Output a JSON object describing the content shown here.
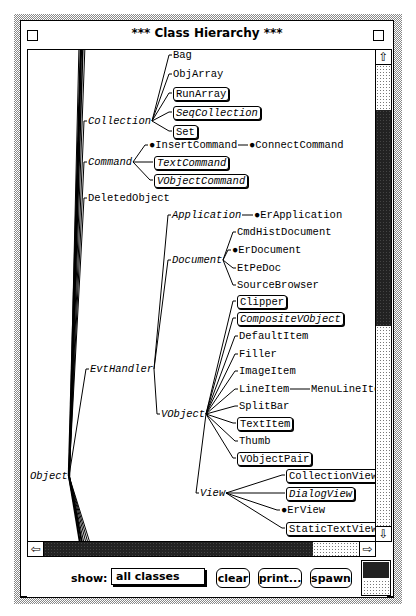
{
  "window": {
    "title": "*** Class Hierarchy ***",
    "close_box": "close-box",
    "zoom_box": "zoom-box"
  },
  "tree": {
    "nodes": [
      {
        "id": "Object",
        "label": "Object",
        "style": "abstract",
        "x": 2,
        "y": 420
      },
      {
        "id": "Collection",
        "label": "Collection",
        "style": "abstract",
        "x": 60,
        "y": 65
      },
      {
        "id": "Bag",
        "label": "Bag",
        "style": "plain",
        "x": 145,
        "y": -1
      },
      {
        "id": "ObjArray",
        "label": "ObjArray",
        "style": "plain",
        "x": 145,
        "y": 18
      },
      {
        "id": "RunArray",
        "label": "RunArray",
        "style": "boxed",
        "x": 145,
        "y": 37
      },
      {
        "id": "SeqCollection",
        "label": "SeqCollection",
        "style": "boxed-abstract",
        "x": 145,
        "y": 56
      },
      {
        "id": "Set",
        "label": "Set",
        "style": "boxed",
        "x": 145,
        "y": 75
      },
      {
        "id": "Command",
        "label": "Command",
        "style": "abstract",
        "x": 60,
        "y": 106
      },
      {
        "id": "InsertCommand",
        "label": "●InsertCommand",
        "style": "plain",
        "x": 121,
        "y": 89
      },
      {
        "id": "ConnectCommand",
        "label": "●ConnectCommand",
        "style": "plain",
        "x": 221,
        "y": 89
      },
      {
        "id": "TextCommand",
        "label": "TextCommand",
        "style": "boxed-abstract",
        "x": 126,
        "y": 106
      },
      {
        "id": "VObjectCommand",
        "label": "VObjectCommand",
        "style": "boxed-abstract",
        "x": 126,
        "y": 124
      },
      {
        "id": "DeletedObject",
        "label": "DeletedObject",
        "style": "plain",
        "x": 60,
        "y": 142
      },
      {
        "id": "Application",
        "label": "Application",
        "style": "abstract",
        "x": 144,
        "y": 159
      },
      {
        "id": "ErApplication",
        "label": "●ErApplication",
        "style": "plain",
        "x": 226,
        "y": 159
      },
      {
        "id": "Document",
        "label": "Document",
        "style": "abstract",
        "x": 144,
        "y": 204
      },
      {
        "id": "CmdHistDocument",
        "label": "CmdHistDocument",
        "style": "plain",
        "x": 209,
        "y": 176
      },
      {
        "id": "ErDocument",
        "label": "●ErDocument",
        "style": "plain",
        "x": 204,
        "y": 194
      },
      {
        "id": "EtPeDoc",
        "label": "EtPeDoc",
        "style": "plain",
        "x": 209,
        "y": 212
      },
      {
        "id": "SourceBrowser",
        "label": "SourceBrowser",
        "style": "plain",
        "x": 209,
        "y": 229
      },
      {
        "id": "EvtHandler",
        "label": "EvtHandler",
        "style": "abstract",
        "x": 62,
        "y": 313
      },
      {
        "id": "VObject",
        "label": "VObject",
        "style": "abstract",
        "x": 133,
        "y": 358
      },
      {
        "id": "Clipper",
        "label": "Clipper",
        "style": "boxed",
        "x": 209,
        "y": 245
      },
      {
        "id": "CompositeVObject",
        "label": "CompositeVObject",
        "style": "boxed-abstract",
        "x": 209,
        "y": 262
      },
      {
        "id": "DefaultItem",
        "label": "DefaultItem",
        "style": "plain",
        "x": 211,
        "y": 280
      },
      {
        "id": "Filler",
        "label": "Filler",
        "style": "plain",
        "x": 211,
        "y": 298
      },
      {
        "id": "ImageItem",
        "label": "ImageItem",
        "style": "plain",
        "x": 211,
        "y": 315
      },
      {
        "id": "LineItem",
        "label": "LineItem",
        "style": "plain",
        "x": 211,
        "y": 333
      },
      {
        "id": "MenuLineItem",
        "label": "MenuLineItem",
        "style": "plain",
        "x": 283,
        "y": 333
      },
      {
        "id": "SplitBar",
        "label": "SplitBar",
        "style": "plain",
        "x": 211,
        "y": 350
      },
      {
        "id": "TextItem",
        "label": "TextItem",
        "style": "boxed",
        "x": 209,
        "y": 367
      },
      {
        "id": "Thumb",
        "label": "Thumb",
        "style": "plain",
        "x": 211,
        "y": 385
      },
      {
        "id": "VObjectPair",
        "label": "VObjectPair",
        "style": "boxed",
        "x": 209,
        "y": 402
      },
      {
        "id": "View",
        "label": "View",
        "style": "abstract",
        "x": 172,
        "y": 437
      },
      {
        "id": "CollectionView",
        "label": "CollectionView",
        "style": "boxed",
        "x": 258,
        "y": 419
      },
      {
        "id": "DialogView",
        "label": "DialogView",
        "style": "boxed-abstract",
        "x": 258,
        "y": 437
      },
      {
        "id": "ErView",
        "label": "●ErView",
        "style": "plain",
        "x": 253,
        "y": 454
      },
      {
        "id": "StaticTextView",
        "label": "StaticTextView",
        "style": "boxed",
        "x": 258,
        "y": 472
      }
    ]
  },
  "scrollbars": {
    "vertical": {
      "up_icon": "⇧",
      "down_icon": "⇩",
      "thumb_start": 60,
      "thumb_end": 276
    },
    "horizontal": {
      "left_icon": "⇦",
      "right_icon": "⇨",
      "thumb_start": 16,
      "thumb_end": 285
    }
  },
  "footer": {
    "show_label": "show:",
    "show_value": "all classes",
    "buttons": [
      {
        "id": "clear",
        "label": "clear"
      },
      {
        "id": "print",
        "label": "print..."
      },
      {
        "id": "spawn",
        "label": "spawn"
      }
    ]
  }
}
